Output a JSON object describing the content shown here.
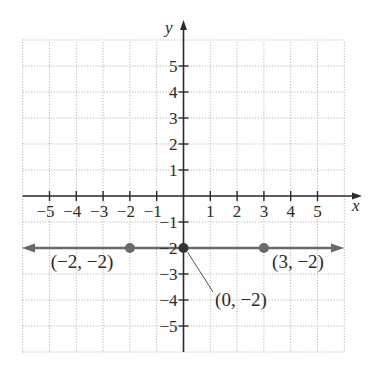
{
  "chart_data": {
    "type": "line",
    "title": "",
    "xlabel": "x",
    "ylabel": "y",
    "xlim": [
      -6,
      6
    ],
    "ylim": [
      -6,
      6
    ],
    "grid": true,
    "x_ticks": [
      -5,
      -4,
      -3,
      -2,
      -1,
      1,
      2,
      3,
      4,
      5
    ],
    "x_tick_labels": [
      "−5",
      "−4",
      "−3",
      "−2",
      "−1",
      "1",
      "2",
      "3",
      "4",
      "5"
    ],
    "y_ticks": [
      5,
      4,
      3,
      2,
      1,
      -1,
      -2,
      -3,
      -4,
      -5
    ],
    "y_tick_labels": [
      "5",
      "4",
      "3",
      "2",
      "1",
      "−1",
      "−2",
      "−3",
      "−4",
      "−5"
    ],
    "series": [
      {
        "name": "y = −2",
        "kind": "horizontal line with arrows",
        "equation_value": -2,
        "color": "#6a6a6a",
        "points": [
          {
            "x": -2,
            "y": -2,
            "label": "(−2, −2)"
          },
          {
            "x": 0,
            "y": -2,
            "label": "(0, −2)"
          },
          {
            "x": 3,
            "y": -2,
            "label": "(3, −2)"
          }
        ]
      }
    ]
  },
  "colors": {
    "axis": "#2b2b2b",
    "grid": "#b8b8b8",
    "line": "#6a6a6a",
    "point": "#6a6a6a",
    "intercept_point": "#333333",
    "text": "#2a2a2a"
  }
}
